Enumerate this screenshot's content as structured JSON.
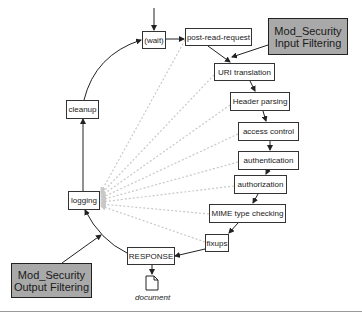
{
  "diagram": {
    "type": "Apache request processing cycle with ModSecurity filtering",
    "phases": [
      {
        "id": "wait",
        "label": "(wait)"
      },
      {
        "id": "post-read-request",
        "label": "post-read-request"
      },
      {
        "id": "uri-translation",
        "label": "URI translation"
      },
      {
        "id": "header-parsing",
        "label": "Header parsing"
      },
      {
        "id": "access-control",
        "label": "access control"
      },
      {
        "id": "authentication",
        "label": "authentication"
      },
      {
        "id": "authorization",
        "label": "authorization"
      },
      {
        "id": "mime-type-checking",
        "label": "MIME type checking"
      },
      {
        "id": "fixups",
        "label": "fixups"
      },
      {
        "id": "response",
        "label": "RESPONSE"
      },
      {
        "id": "logging",
        "label": "logging"
      },
      {
        "id": "cleanup",
        "label": "cleanup"
      }
    ],
    "filters": {
      "input": {
        "line1": "Mod_Security",
        "line2": "Input Filtering"
      },
      "output": {
        "line1": "Mod_Security",
        "line2": "Output Filtering"
      }
    },
    "document": {
      "label": "document",
      "icon": "document-icon"
    },
    "colors": {
      "filter_fill": "#a9a9a9",
      "box_border": "#333333",
      "dashed_line": "#c8c8c8",
      "arrow": "#222222"
    },
    "edges": [
      [
        "entry",
        "wait"
      ],
      [
        "wait",
        "post-read-request"
      ],
      [
        "post-read-request",
        "uri-translation"
      ],
      [
        "input-filter",
        "uri-translation"
      ],
      [
        "uri-translation",
        "header-parsing"
      ],
      [
        "header-parsing",
        "access-control"
      ],
      [
        "access-control",
        "authentication"
      ],
      [
        "authentication",
        "authorization"
      ],
      [
        "authorization",
        "mime-type-checking"
      ],
      [
        "mime-type-checking",
        "fixups"
      ],
      [
        "fixups",
        "response"
      ],
      [
        "response",
        "document"
      ],
      [
        "response",
        "logging"
      ],
      [
        "output-filter",
        "logging"
      ],
      [
        "logging",
        "cleanup"
      ],
      [
        "cleanup",
        "wait"
      ]
    ]
  }
}
